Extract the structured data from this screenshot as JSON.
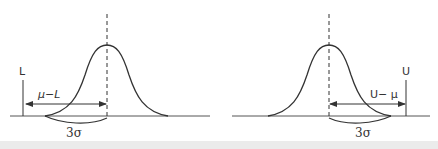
{
  "figure": {
    "colors": {
      "line": "#333333",
      "baseline": "#555555",
      "band": "#ebebeb"
    },
    "left_panel": {
      "limit_label": "L",
      "distance_label": "μ−L",
      "sigma_label": "3σ"
    },
    "right_panel": {
      "limit_label": "U",
      "distance_label": "U− μ",
      "sigma_label": "3σ"
    }
  }
}
